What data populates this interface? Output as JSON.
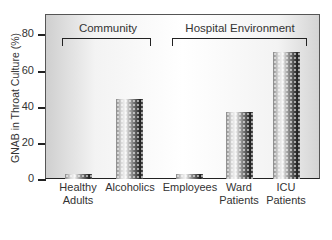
{
  "chart_data": {
    "type": "bar",
    "title": "",
    "xlabel": "",
    "ylabel": "GNAB in Throat Culture (%)",
    "ylim": [
      0,
      90
    ],
    "yticks": [
      0,
      20,
      40,
      60,
      80
    ],
    "grid": false,
    "legend": null,
    "categories": [
      "Healthy Adults",
      "Alcoholics",
      "Employees",
      "Ward Patients",
      "ICU Patients"
    ],
    "values": [
      3,
      44,
      3,
      37,
      70
    ],
    "groups": [
      {
        "label": "Community",
        "categories": [
          "Healthy Adults",
          "Alcoholics"
        ]
      },
      {
        "label": "Hospital Environment",
        "categories": [
          "Employees",
          "Ward Patients",
          "ICU Patients"
        ]
      }
    ]
  },
  "axis": {
    "ylabel": "GNAB in Throat Culture (%)",
    "yticks": [
      "80",
      "60",
      "40",
      "20",
      "0"
    ]
  },
  "groups": {
    "community": "Community",
    "hospital": "Hospital Environment"
  },
  "xlabels": [
    {
      "line1": "Healthy",
      "line2": "Adults"
    },
    {
      "line1": "Alcoholics",
      "line2": ""
    },
    {
      "line1": "Employees",
      "line2": ""
    },
    {
      "line1": "Ward",
      "line2": "Patients"
    },
    {
      "line1": "ICU",
      "line2": "Patients"
    }
  ]
}
